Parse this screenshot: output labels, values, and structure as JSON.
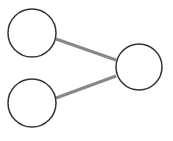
{
  "diagram": {
    "type": "graph",
    "background": "#ffffff",
    "node_stroke": "#333333",
    "node_fill": "#ffffff",
    "edge_color": "#888888",
    "nodes": [
      {
        "id": "n1",
        "cx": 32,
        "cy": 33,
        "r": 24
      },
      {
        "id": "n2",
        "cx": 32,
        "cy": 103,
        "r": 24
      },
      {
        "id": "n3",
        "cx": 139,
        "cy": 67,
        "r": 23
      }
    ],
    "edges": [
      {
        "from": "n1",
        "to": "n3",
        "x1": 56,
        "y1": 39,
        "x2": 116,
        "y2": 60
      },
      {
        "from": "n2",
        "to": "n3",
        "x1": 56,
        "y1": 98,
        "x2": 116,
        "y2": 76
      }
    ]
  }
}
